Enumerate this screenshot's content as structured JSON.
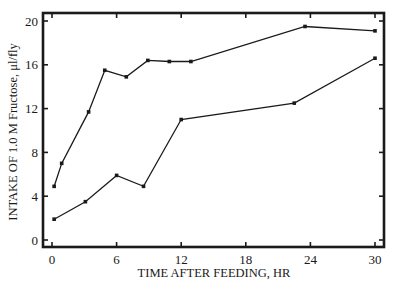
{
  "chart_data": {
    "type": "line",
    "title": "",
    "xlabel": "TIME AFTER FEEDING, HR",
    "ylabel": "INTAKE OF 1.0 M Fructose, μl/fly",
    "xlim": [
      0,
      30
    ],
    "ylim": [
      0,
      20
    ],
    "xticks": [
      0,
      6,
      12,
      18,
      24,
      30
    ],
    "yticks": [
      0,
      4,
      8,
      12,
      16,
      20
    ],
    "grid": false,
    "legend": null,
    "series": [
      {
        "name": "upper",
        "x": [
          0.2,
          0.9,
          3.4,
          4.9,
          6.9,
          8.9,
          10.9,
          12.9,
          23.5,
          30
        ],
        "values": [
          4.9,
          7.0,
          11.7,
          15.5,
          14.9,
          16.4,
          16.3,
          16.3,
          19.5,
          19.1
        ]
      },
      {
        "name": "lower",
        "x": [
          0.2,
          3.1,
          6.0,
          8.5,
          12.0,
          22.5,
          30
        ],
        "values": [
          1.9,
          3.5,
          5.9,
          4.9,
          11.0,
          12.5,
          16.6
        ]
      }
    ]
  },
  "colors": {
    "line": "#1a1a1a",
    "background": "#ffffff"
  }
}
